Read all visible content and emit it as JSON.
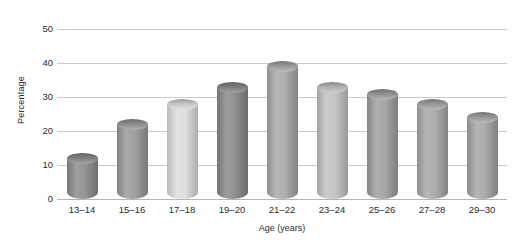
{
  "chart_data": {
    "type": "bar",
    "title": "",
    "xlabel": "Age (years)",
    "ylabel": "Percentage",
    "categories": [
      "13–14",
      "15–16",
      "17–18",
      "19–20",
      "21–22",
      "23–24",
      "25–26",
      "27–28",
      "29–30"
    ],
    "values": [
      12,
      22,
      28,
      33,
      39,
      33,
      31,
      28,
      24
    ],
    "ylim": [
      0,
      50
    ],
    "yticks": [
      0,
      10,
      20,
      30,
      40,
      50
    ],
    "ytick_labels": [
      "0",
      "10",
      "20",
      "30",
      "40",
      "50"
    ],
    "grid": true,
    "legend": "none",
    "bar_style": "cylinder-3d",
    "bar_colors": [
      "#8d8d8d",
      "#9a9a9a",
      "#dcdcdc",
      "#8a8a8a",
      "#a9a9a9",
      "#c2c2c2",
      "#a0a0a0",
      "#a8a8a8",
      "#a6a6a6"
    ],
    "colors": {
      "background": "#ffffff",
      "gridline": "#c9c9c9",
      "axis": "#b5b5b5",
      "text": "#2b2b2b"
    }
  }
}
